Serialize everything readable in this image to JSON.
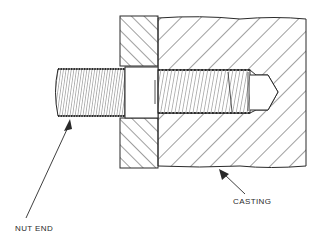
{
  "diagram": {
    "labels": {
      "nut_end": "NUT END",
      "casting": "CASTING"
    },
    "colors": {
      "line": "#2a2a2a",
      "background": "#ffffff"
    }
  }
}
